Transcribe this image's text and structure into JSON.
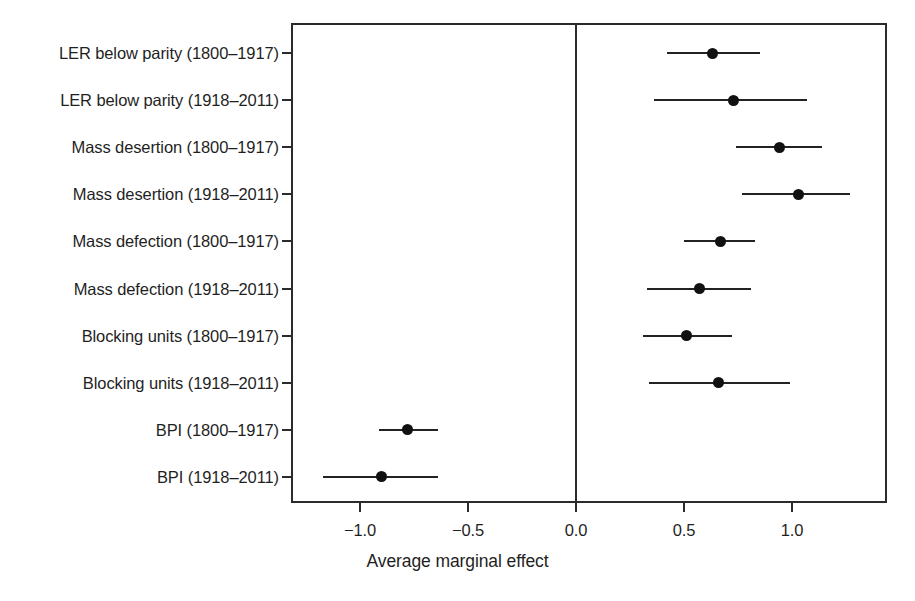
{
  "chart_data": {
    "type": "scatter",
    "subtype": "forest-plot",
    "title": "",
    "xlabel": "Average marginal effect",
    "ylabel": "",
    "xlim": [
      -1.32,
      1.44
    ],
    "ylim": [
      0,
      10
    ],
    "grid": false,
    "legend": null,
    "xticks": [
      -1.0,
      -0.5,
      0.0,
      0.5,
      1.0
    ],
    "xtick_labels": [
      "−1.0",
      "−0.5",
      "0.0",
      "0.5",
      "1.0"
    ],
    "reference_line": 0.0,
    "categories": [
      "LER below parity (1800–1917)",
      "LER below parity (1918–2011)",
      "Mass desertion (1800–1917)",
      "Mass desertion (1918–2011)",
      "Mass defection (1800–1917)",
      "Mass defection (1918–2011)",
      "Blocking units (1800–1917)",
      "Blocking units (1918–2011)",
      "BPI (1800–1917)",
      "BPI (1918–2011)"
    ],
    "values": [
      0.63,
      0.73,
      0.94,
      1.03,
      0.67,
      0.57,
      0.51,
      0.66,
      -0.78,
      -0.9
    ],
    "ci_low": [
      0.42,
      0.36,
      0.74,
      0.77,
      0.5,
      0.33,
      0.31,
      0.34,
      -0.91,
      -1.17
    ],
    "ci_high": [
      0.85,
      1.07,
      1.14,
      1.27,
      0.83,
      0.81,
      0.72,
      0.99,
      -0.64,
      -0.64
    ],
    "points": [
      {
        "label": "LER below parity (1800–1917)",
        "estimate": 0.63,
        "ci_low": 0.42,
        "ci_high": 0.85
      },
      {
        "label": "LER below parity (1918–2011)",
        "estimate": 0.73,
        "ci_low": 0.36,
        "ci_high": 1.07
      },
      {
        "label": "Mass desertion (1800–1917)",
        "estimate": 0.94,
        "ci_low": 0.74,
        "ci_high": 1.14
      },
      {
        "label": "Mass desertion (1918–2011)",
        "estimate": 1.03,
        "ci_low": 0.77,
        "ci_high": 1.27
      },
      {
        "label": "Mass defection (1800–1917)",
        "estimate": 0.67,
        "ci_low": 0.5,
        "ci_high": 0.83
      },
      {
        "label": "Mass defection (1918–2011)",
        "estimate": 0.57,
        "ci_low": 0.33,
        "ci_high": 0.81
      },
      {
        "label": "Blocking units (1800–1917)",
        "estimate": 0.51,
        "ci_low": 0.31,
        "ci_high": 0.72
      },
      {
        "label": "Blocking units (1918–2011)",
        "estimate": 0.66,
        "ci_low": 0.34,
        "ci_high": 0.99
      },
      {
        "label": "BPI (1800–1917)",
        "estimate": -0.78,
        "ci_low": -0.91,
        "ci_high": -0.64
      },
      {
        "label": "BPI (1918–2011)",
        "estimate": -0.9,
        "ci_low": -1.17,
        "ci_high": -0.64
      }
    ],
    "colors": {
      "point": "#111111",
      "interval": "#222222",
      "axis": "#2b2b2b",
      "text": "#1f1f1f",
      "background": "#ffffff"
    }
  }
}
